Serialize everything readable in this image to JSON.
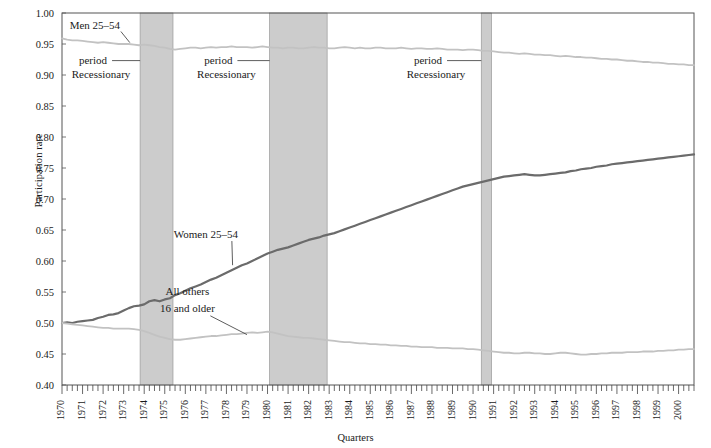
{
  "chart_data": {
    "type": "line",
    "title": "",
    "xlabel": "Quarters",
    "ylabel": "Participation rate",
    "ylim": [
      0.4,
      1.0
    ],
    "ytick_labels": [
      "0.40",
      "0.45",
      "0.50",
      "0.55",
      "0.60",
      "0.65",
      "0.70",
      "0.75",
      "0.80",
      "0.85",
      "0.90",
      "0.95",
      "1.00"
    ],
    "ytick_values": [
      0.4,
      0.45,
      0.5,
      0.55,
      0.6,
      0.65,
      0.7,
      0.75,
      0.8,
      0.85,
      0.9,
      0.95,
      1.0
    ],
    "xlim": [
      1970.0,
      2000.75
    ],
    "grid": false,
    "legend_position": "inline-annotations",
    "x_categories": [
      "1970",
      "1971",
      "1972",
      "1973",
      "1974",
      "1975",
      "1976",
      "1977",
      "1978",
      "1979",
      "1980",
      "1981",
      "1982",
      "1983",
      "1984",
      "1985",
      "1986",
      "1987",
      "1988",
      "1989",
      "1990",
      "1991",
      "1992",
      "1993",
      "1994",
      "1995",
      "1996",
      "1997",
      "1998",
      "1999",
      "2000"
    ],
    "series": [
      {
        "name": "Men 25–54",
        "color": "#c2c2c2",
        "label_x": 1971.6,
        "label_y": 0.975,
        "leader_to_x": 1973.3,
        "leader_to_y": 0.949,
        "values": [
          0.959,
          0.957,
          0.956,
          0.956,
          0.955,
          0.954,
          0.953,
          0.952,
          0.953,
          0.952,
          0.951,
          0.95,
          0.95,
          0.95,
          0.949,
          0.948,
          0.949,
          0.948,
          0.947,
          0.945,
          0.944,
          0.942,
          0.941,
          0.942,
          0.943,
          0.944,
          0.944,
          0.943,
          0.944,
          0.945,
          0.944,
          0.945,
          0.945,
          0.946,
          0.945,
          0.945,
          0.945,
          0.944,
          0.945,
          0.946,
          0.945,
          0.944,
          0.944,
          0.943,
          0.944,
          0.944,
          0.943,
          0.943,
          0.944,
          0.945,
          0.944,
          0.944,
          0.943,
          0.943,
          0.944,
          0.945,
          0.944,
          0.943,
          0.944,
          0.943,
          0.943,
          0.944,
          0.944,
          0.943,
          0.943,
          0.943,
          0.944,
          0.943,
          0.942,
          0.943,
          0.943,
          0.942,
          0.942,
          0.943,
          0.942,
          0.941,
          0.941,
          0.941,
          0.94,
          0.941,
          0.941,
          0.94,
          0.939,
          0.939,
          0.938,
          0.937,
          0.936,
          0.936,
          0.935,
          0.934,
          0.935,
          0.934,
          0.933,
          0.933,
          0.932,
          0.932,
          0.931,
          0.93,
          0.931,
          0.93,
          0.929,
          0.929,
          0.928,
          0.928,
          0.927,
          0.926,
          0.926,
          0.925,
          0.925,
          0.924,
          0.923,
          0.923,
          0.922,
          0.921,
          0.921,
          0.92,
          0.92,
          0.919,
          0.918,
          0.918,
          0.917,
          0.917,
          0.916,
          0.916
        ]
      },
      {
        "name": "Women 25–54",
        "color": "#6b6b6b",
        "label_x": 1977.0,
        "label_y": 0.637,
        "leader_to_x": 1978.3,
        "leader_to_y": 0.59,
        "values": [
          0.5,
          0.501,
          0.5,
          0.502,
          0.503,
          0.504,
          0.505,
          0.508,
          0.51,
          0.513,
          0.514,
          0.516,
          0.52,
          0.524,
          0.527,
          0.528,
          0.53,
          0.535,
          0.537,
          0.535,
          0.538,
          0.54,
          0.545,
          0.548,
          0.552,
          0.556,
          0.559,
          0.562,
          0.566,
          0.57,
          0.573,
          0.577,
          0.581,
          0.585,
          0.589,
          0.593,
          0.596,
          0.6,
          0.604,
          0.608,
          0.612,
          0.615,
          0.618,
          0.62,
          0.622,
          0.625,
          0.628,
          0.631,
          0.634,
          0.636,
          0.638,
          0.641,
          0.643,
          0.645,
          0.648,
          0.651,
          0.654,
          0.657,
          0.66,
          0.663,
          0.666,
          0.669,
          0.672,
          0.675,
          0.678,
          0.681,
          0.684,
          0.687,
          0.69,
          0.693,
          0.696,
          0.699,
          0.702,
          0.705,
          0.708,
          0.711,
          0.714,
          0.717,
          0.72,
          0.722,
          0.724,
          0.726,
          0.728,
          0.73,
          0.732,
          0.734,
          0.736,
          0.737,
          0.738,
          0.739,
          0.74,
          0.739,
          0.738,
          0.738,
          0.739,
          0.74,
          0.741,
          0.742,
          0.743,
          0.745,
          0.746,
          0.748,
          0.749,
          0.75,
          0.752,
          0.753,
          0.754,
          0.756,
          0.757,
          0.758,
          0.759,
          0.76,
          0.761,
          0.762,
          0.763,
          0.764,
          0.765,
          0.766,
          0.767,
          0.768,
          0.769,
          0.77,
          0.771,
          0.772
        ]
      },
      {
        "name": "All others 16 and older",
        "color": "#c2c2c2",
        "label_x": 1976.1,
        "label_y": 0.545,
        "label_x2": 1976.1,
        "label_y2": 0.518,
        "leader_to_x": 1979.0,
        "leader_to_y": 0.478,
        "values": [
          0.5,
          0.499,
          0.498,
          0.497,
          0.496,
          0.495,
          0.494,
          0.493,
          0.492,
          0.492,
          0.491,
          0.491,
          0.491,
          0.491,
          0.49,
          0.489,
          0.487,
          0.484,
          0.481,
          0.478,
          0.476,
          0.474,
          0.473,
          0.473,
          0.474,
          0.475,
          0.476,
          0.477,
          0.478,
          0.479,
          0.479,
          0.48,
          0.481,
          0.482,
          0.482,
          0.483,
          0.484,
          0.485,
          0.484,
          0.485,
          0.486,
          0.485,
          0.483,
          0.481,
          0.479,
          0.478,
          0.477,
          0.476,
          0.476,
          0.475,
          0.474,
          0.473,
          0.472,
          0.471,
          0.47,
          0.469,
          0.469,
          0.468,
          0.467,
          0.467,
          0.466,
          0.466,
          0.465,
          0.465,
          0.464,
          0.464,
          0.463,
          0.463,
          0.462,
          0.462,
          0.461,
          0.461,
          0.461,
          0.46,
          0.46,
          0.46,
          0.459,
          0.459,
          0.459,
          0.458,
          0.458,
          0.457,
          0.456,
          0.455,
          0.454,
          0.453,
          0.452,
          0.452,
          0.451,
          0.451,
          0.452,
          0.452,
          0.451,
          0.451,
          0.45,
          0.45,
          0.451,
          0.452,
          0.452,
          0.451,
          0.45,
          0.449,
          0.449,
          0.45,
          0.45,
          0.451,
          0.451,
          0.452,
          0.452,
          0.452,
          0.453,
          0.453,
          0.453,
          0.454,
          0.454,
          0.454,
          0.455,
          0.455,
          0.456,
          0.456,
          0.457,
          0.457,
          0.458,
          0.458
        ]
      }
    ],
    "recession_bands": [
      {
        "label_line1": "Recessionary",
        "label_line2": "period",
        "start": 1973.8,
        "end": 1975.4,
        "label_x": 1971.9,
        "label_y": 0.895,
        "leader_x": 1973.8
      },
      {
        "label_line1": "Recessionary",
        "label_line2": "period",
        "start": 1980.1,
        "end": 1982.9,
        "label_x": 1978.0,
        "label_y": 0.895,
        "leader_x": 1980.1
      },
      {
        "label_line1": "Recessionary",
        "label_line2": "period",
        "start": 1990.4,
        "end": 1990.9,
        "label_x": 1988.2,
        "label_y": 0.895,
        "leader_x": 1990.4
      }
    ],
    "band_color": "#cccccc"
  }
}
